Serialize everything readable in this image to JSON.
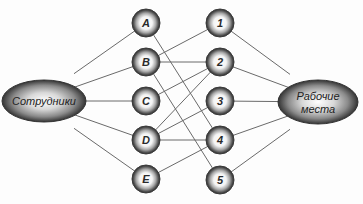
{
  "diagram": {
    "left_group": {
      "label": "Сотрудники",
      "cx": 44,
      "cy": 101,
      "rx": 42,
      "ry": 21
    },
    "right_group": {
      "label_line1": "Рабочие",
      "label_line2": "места",
      "cx": 318,
      "cy": 102,
      "rx": 40,
      "ry": 22
    },
    "employees": [
      {
        "id": "A",
        "label": "A",
        "cx": 146,
        "cy": 23
      },
      {
        "id": "B",
        "label": "B",
        "cx": 146,
        "cy": 62
      },
      {
        "id": "C",
        "label": "C",
        "cx": 146,
        "cy": 101
      },
      {
        "id": "D",
        "label": "D",
        "cx": 146,
        "cy": 140
      },
      {
        "id": "E",
        "label": "E",
        "cx": 146,
        "cy": 179
      }
    ],
    "workplaces": [
      {
        "id": "1",
        "label": "1",
        "cx": 220,
        "cy": 23
      },
      {
        "id": "2",
        "label": "2",
        "cx": 220,
        "cy": 62
      },
      {
        "id": "3",
        "label": "3",
        "cx": 220,
        "cy": 101
      },
      {
        "id": "4",
        "label": "4",
        "cx": 220,
        "cy": 140
      },
      {
        "id": "5",
        "label": "5",
        "cx": 220,
        "cy": 180
      }
    ],
    "node_radius": 14,
    "edges": [
      [
        "A",
        "4"
      ],
      [
        "B",
        "1"
      ],
      [
        "B",
        "2"
      ],
      [
        "B",
        "5"
      ],
      [
        "C",
        "2"
      ],
      [
        "D",
        "2"
      ],
      [
        "D",
        "3"
      ],
      [
        "D",
        "4"
      ],
      [
        "E",
        "4"
      ]
    ],
    "colors": {
      "line": "#6a6a6a",
      "node_outer": "#3a3a3a",
      "node_inner": "#ffffff",
      "text": "#2a2a2a"
    }
  }
}
